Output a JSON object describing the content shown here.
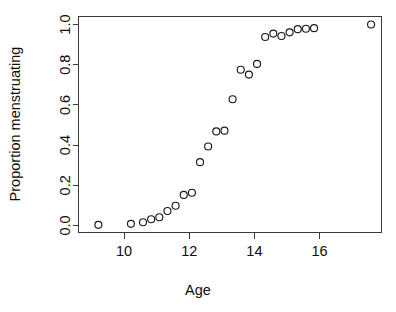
{
  "chart_data": {
    "type": "scatter",
    "title": "",
    "xlabel": "Age",
    "ylabel": "Proportion menstruating",
    "xlim": [
      8.6,
      17.9
    ],
    "ylim": [
      -0.035,
      1.04
    ],
    "grid": false,
    "legend": null,
    "x_ticks": [
      10,
      12,
      14,
      16
    ],
    "x_tick_labels": [
      "10",
      "12",
      "14",
      "16"
    ],
    "y_ticks": [
      0.0,
      0.2,
      0.4,
      0.6,
      0.8,
      1.0
    ],
    "y_tick_labels": [
      "0.0",
      "0.2",
      "0.4",
      "0.6",
      "0.8",
      "1.0"
    ],
    "point_marker": "open-circle",
    "point_color": "#1a1a1a",
    "series": [
      {
        "name": "Proportion menstruating",
        "x": [
          9.21,
          10.21,
          10.58,
          10.83,
          11.08,
          11.33,
          11.58,
          11.83,
          12.08,
          12.33,
          12.58,
          12.83,
          13.08,
          13.33,
          13.58,
          13.83,
          14.08,
          14.33,
          14.58,
          14.83,
          15.08,
          15.33,
          15.58,
          15.83,
          17.58
        ],
        "y": [
          0.003,
          0.008,
          0.016,
          0.031,
          0.041,
          0.072,
          0.098,
          0.152,
          0.163,
          0.315,
          0.393,
          0.468,
          0.472,
          0.628,
          0.775,
          0.751,
          0.804,
          0.938,
          0.955,
          0.943,
          0.961,
          0.977,
          0.979,
          0.982,
          1.0
        ]
      }
    ]
  },
  "axes": {
    "x_title": "Age",
    "y_title": "Proportion menstruating"
  }
}
